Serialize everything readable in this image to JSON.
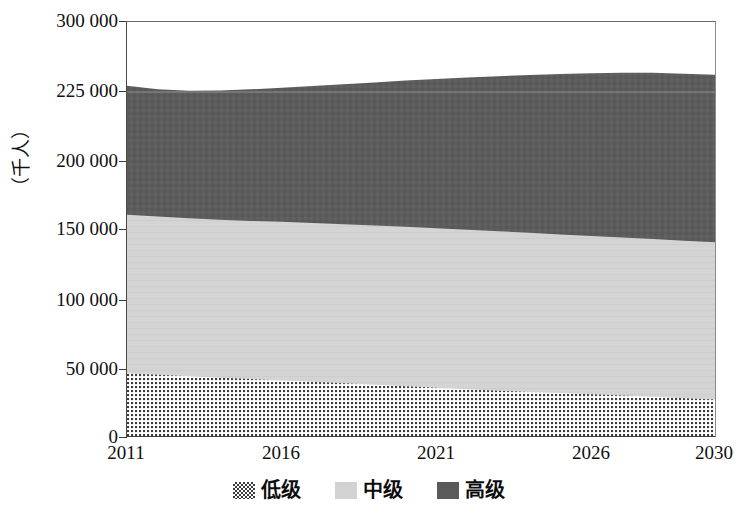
{
  "chart_data": {
    "type": "area",
    "title": "",
    "subtitle": "",
    "xlabel": "",
    "ylabel": "（千人）",
    "stacked": true,
    "grid": true,
    "legend_position": "bottom",
    "x": [
      2011,
      2012,
      2013,
      2014,
      2015,
      2016,
      2017,
      2018,
      2019,
      2020,
      2021,
      2022,
      2023,
      2024,
      2025,
      2026,
      2027,
      2028,
      2029,
      2030
    ],
    "xlim": [
      2011,
      2030
    ],
    "x_tick_labels": [
      "2011",
      "2016",
      "2021",
      "2026",
      "2030"
    ],
    "x_tick_values": [
      2011,
      2016,
      2021,
      2026,
      2030
    ],
    "ylim": [
      0,
      300000
    ],
    "y_tick_labels": [
      "0",
      "50 000",
      "100 000",
      "150 000",
      "200 000",
      "225 000",
      "300 000"
    ],
    "y_tick_values": [
      0,
      50000,
      100000,
      150000,
      200000,
      225000,
      300000
    ],
    "series": [
      {
        "name": "低级",
        "fill": "dotted",
        "color": "#d9d9d9",
        "values": [
          47500,
          46500,
          45400,
          44300,
          43300,
          42300,
          41300,
          40200,
          39100,
          38000,
          36900,
          35800,
          34800,
          33900,
          33000,
          32100,
          31200,
          30300,
          29300,
          28300
        ]
      },
      {
        "name": "中级",
        "fill": "solid",
        "color": "#d2d2d2",
        "values": [
          113800,
          113400,
          113200,
          113200,
          113400,
          113700,
          113900,
          114100,
          114300,
          114400,
          114400,
          114400,
          114300,
          114100,
          113900,
          113700,
          113500,
          113300,
          113100,
          113000
        ]
      },
      {
        "name": "高级",
        "fill": "solid",
        "color": "#5a5a5a",
        "values": [
          70500,
          68100,
          67800,
          69200,
          71200,
          73500,
          76200,
          79000,
          81900,
          84800,
          87600,
          90300,
          92900,
          95300,
          97500,
          99400,
          101000,
          101900,
          102100,
          102300
        ]
      }
    ],
    "totals": [
      231800,
      228000,
      226400,
      226700,
      227900,
      229500,
      231400,
      233300,
      235300,
      237200,
      238900,
      240500,
      242000,
      243300,
      244400,
      245200,
      245700,
      245500,
      244500,
      243600
    ]
  },
  "y_axis": {
    "title": "（千人）",
    "ticks": [
      {
        "label": "300 000",
        "y": 21
      },
      {
        "label": "225 000",
        "y": 91
      },
      {
        "label": "200 000",
        "y": 161
      },
      {
        "label": "150 000",
        "y": 229
      },
      {
        "label": "100 000",
        "y": 300
      },
      {
        "label": "50 000",
        "y": 369
      },
      {
        "label": "0",
        "y": 437
      }
    ]
  },
  "x_axis": {
    "ticks": [
      {
        "label": "2011",
        "x": 126
      },
      {
        "label": "2016",
        "x": 281
      },
      {
        "label": "2021",
        "x": 436
      },
      {
        "label": "2026",
        "x": 591
      },
      {
        "label": "2030",
        "x": 714
      }
    ]
  },
  "legend": {
    "items": [
      {
        "label": "低级",
        "swatch": "dotted",
        "color": "#d8d8d8"
      },
      {
        "label": "中级",
        "swatch": "light-gray",
        "color": "#d2d2d2"
      },
      {
        "label": "高级",
        "swatch": "dark-gray",
        "color": "#5a5a5a"
      }
    ]
  },
  "plot": {
    "gridline_value": "225 000",
    "gridline_y": 91
  }
}
